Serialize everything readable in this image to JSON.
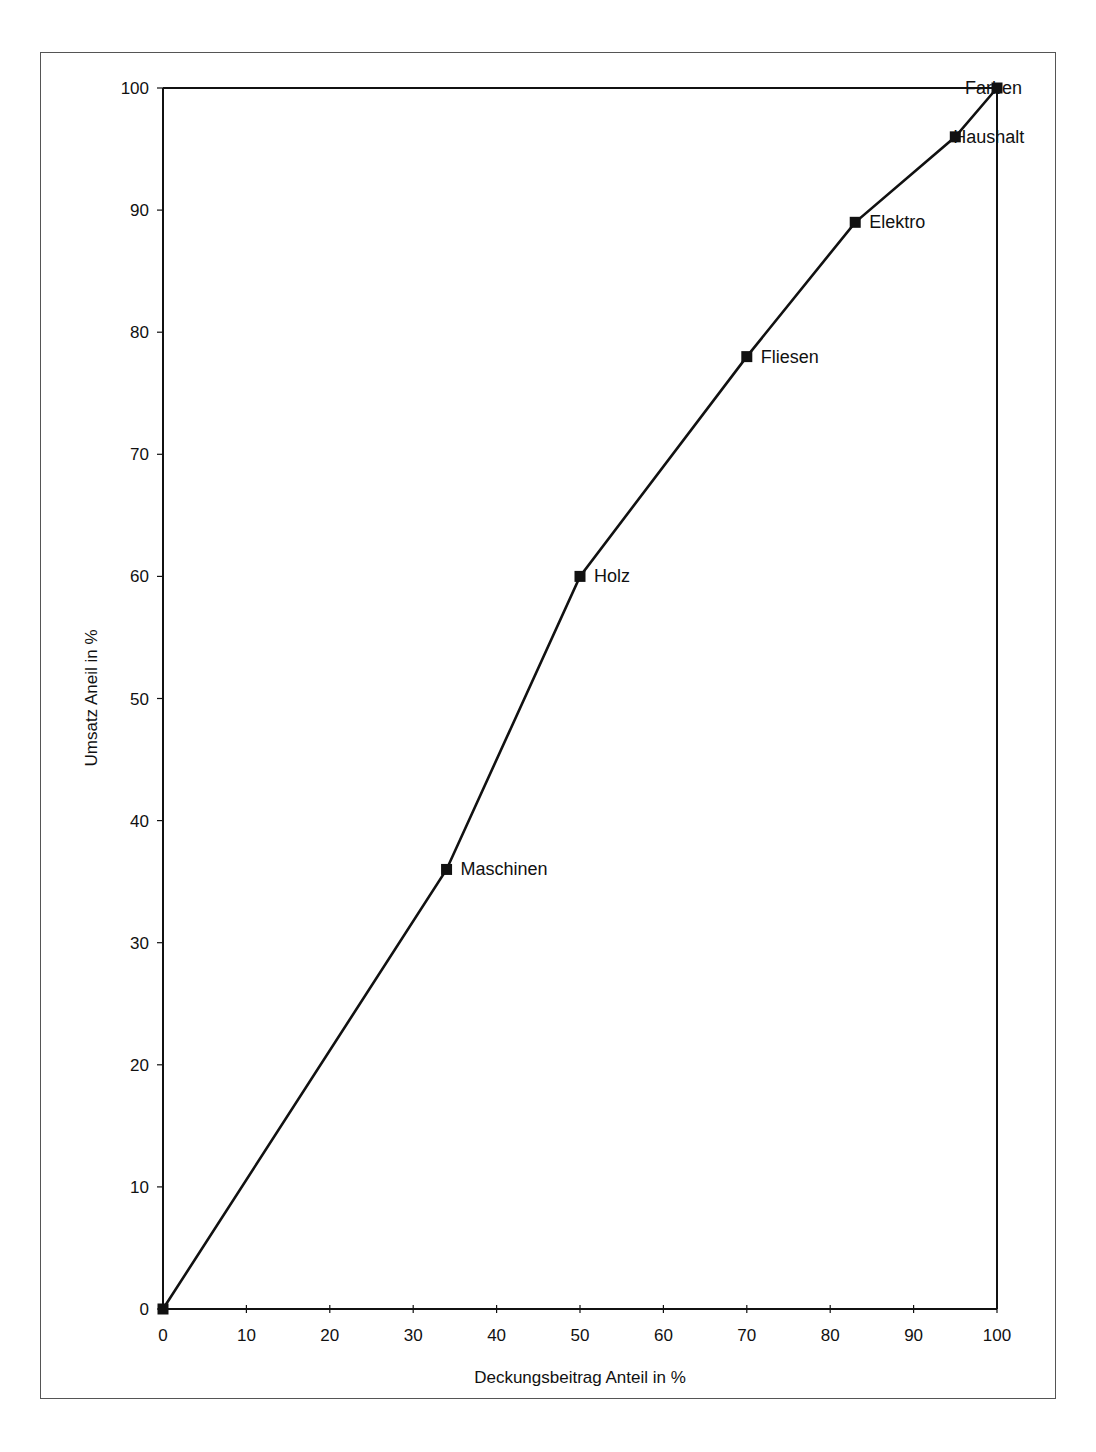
{
  "chart_data": {
    "type": "line",
    "title": "",
    "xlabel": "Deckungsbeitrag Anteil in %",
    "ylabel": "Umsatz Aneil in %",
    "xlim": [
      0,
      100
    ],
    "ylim": [
      0,
      100
    ],
    "x_ticks": [
      "0",
      "10",
      "20",
      "30",
      "40",
      "50",
      "60",
      "70",
      "80",
      "90",
      "100"
    ],
    "y_ticks": [
      "0",
      "10",
      "20",
      "30",
      "40",
      "50",
      "60",
      "70",
      "80",
      "90",
      "100"
    ],
    "grid": false,
    "legend": null,
    "series": [
      {
        "name": "Kumulierte Anteile",
        "points": [
          {
            "label": "",
            "x": 0,
            "y": 0
          },
          {
            "label": "Maschinen",
            "x": 34,
            "y": 36
          },
          {
            "label": "Holz",
            "x": 50,
            "y": 60
          },
          {
            "label": "Fliesen",
            "x": 70,
            "y": 78
          },
          {
            "label": "Elektro",
            "x": 83,
            "y": 89
          },
          {
            "label": "Haushalt",
            "x": 95,
            "y": 96
          },
          {
            "label": "Farben",
            "x": 100,
            "y": 100
          }
        ]
      }
    ],
    "reference_lines": [
      {
        "from": [
          0,
          100
        ],
        "to": [
          100,
          100
        ]
      },
      {
        "from": [
          100,
          100
        ],
        "to": [
          100,
          0
        ]
      }
    ]
  },
  "colors": {
    "line": "#111111",
    "marker": "#111111",
    "frame": "#555555"
  }
}
